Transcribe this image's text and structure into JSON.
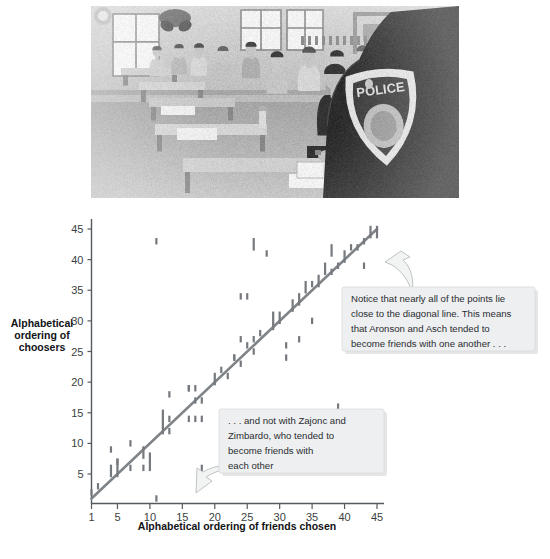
{
  "figure": {
    "photo": {
      "alt_description": "Black and white photograph of a police academy classroom with cadets seated at tables, a uniformed officer with a POLICE shoulder patch in the foreground",
      "palette": {
        "wall": "#c9c5bd",
        "floor": "#b5b2ac",
        "uniform": "#2b2b2d",
        "window": "#f2f0ea",
        "patch": "#dedad2"
      }
    },
    "caption": ""
  },
  "chart_data": {
    "type": "scatter",
    "title": "",
    "xlabel": "Alphabetical ordering of friends chosen",
    "ylabel": "Alphabetical ordering of choosers",
    "xlim": [
      0,
      46
    ],
    "ylim": [
      0,
      46
    ],
    "xticks": [
      1,
      5,
      10,
      15,
      20,
      25,
      30,
      35,
      40,
      45
    ],
    "xticklabels": [
      "1",
      "5",
      "10",
      "15",
      "20",
      "25",
      "30",
      "35",
      "40",
      "45"
    ],
    "yticks": [
      5,
      10,
      15,
      20,
      25,
      30,
      35,
      40,
      45
    ],
    "yticklabels": [
      "5",
      "10",
      "15",
      "20",
      "25",
      "30",
      "35",
      "40",
      "45"
    ],
    "grid": false,
    "legend": false,
    "marker_color": "#75797d",
    "marker_style": "vertical-dash",
    "reference_line": {
      "name": "diagonal line",
      "from": [
        1,
        1
      ],
      "to": [
        45,
        45
      ],
      "color": "#7f8488"
    },
    "points": [
      [
        1,
        2
      ],
      [
        2,
        3
      ],
      [
        4,
        5
      ],
      [
        4,
        6
      ],
      [
        4,
        9
      ],
      [
        5,
        5
      ],
      [
        5,
        6
      ],
      [
        5,
        7
      ],
      [
        5,
        7
      ],
      [
        7,
        6
      ],
      [
        7,
        10
      ],
      [
        9,
        6
      ],
      [
        9,
        8
      ],
      [
        9,
        9
      ],
      [
        10,
        6
      ],
      [
        10,
        7
      ],
      [
        10,
        8
      ],
      [
        11,
        1
      ],
      [
        11,
        43
      ],
      [
        12,
        12
      ],
      [
        12,
        13
      ],
      [
        12,
        14
      ],
      [
        12,
        15
      ],
      [
        13,
        12
      ],
      [
        13,
        14
      ],
      [
        13,
        18
      ],
      [
        16,
        14
      ],
      [
        16,
        19
      ],
      [
        16,
        19
      ],
      [
        17,
        14
      ],
      [
        17,
        17
      ],
      [
        17,
        19
      ],
      [
        18,
        6
      ],
      [
        18,
        14
      ],
      [
        18,
        17
      ],
      [
        20,
        20
      ],
      [
        20,
        21
      ],
      [
        21,
        22
      ],
      [
        22,
        21
      ],
      [
        23,
        24
      ],
      [
        23,
        24
      ],
      [
        24,
        23
      ],
      [
        24,
        27
      ],
      [
        24,
        34
      ],
      [
        25,
        26
      ],
      [
        25,
        34
      ],
      [
        26,
        25
      ],
      [
        26,
        27
      ],
      [
        26,
        42
      ],
      [
        26,
        43
      ],
      [
        27,
        28
      ],
      [
        28,
        41
      ],
      [
        29,
        29
      ],
      [
        29,
        30
      ],
      [
        29,
        31
      ],
      [
        30,
        30
      ],
      [
        30,
        31
      ],
      [
        31,
        24
      ],
      [
        31,
        26
      ],
      [
        32,
        32
      ],
      [
        32,
        33
      ],
      [
        33,
        27
      ],
      [
        33,
        33
      ],
      [
        33,
        34
      ],
      [
        34,
        35
      ],
      [
        34,
        36
      ],
      [
        35,
        30
      ],
      [
        35,
        36
      ],
      [
        36,
        36
      ],
      [
        36,
        37
      ],
      [
        37,
        38
      ],
      [
        37,
        39
      ],
      [
        38,
        38
      ],
      [
        38,
        41
      ],
      [
        38,
        42
      ],
      [
        39,
        16
      ],
      [
        39,
        39
      ],
      [
        40,
        40
      ],
      [
        40,
        41
      ],
      [
        41,
        42
      ],
      [
        42,
        42
      ],
      [
        43,
        39
      ],
      [
        43,
        43
      ],
      [
        44,
        44
      ],
      [
        44,
        45
      ],
      [
        45,
        44
      ],
      [
        45,
        45
      ]
    ]
  },
  "annotations": [
    {
      "id": "callout-upper",
      "lines": [
        "Notice that nearly all of the points lie",
        "close to the diagonal line. This means",
        "that Aronson and Asch tended to",
        "become friends with one another . . ."
      ]
    },
    {
      "id": "callout-lower",
      "lines": [
        ". . . and not with Zajonc and",
        "Zimbardo, who tended to",
        "become friends with",
        "each other"
      ]
    }
  ]
}
